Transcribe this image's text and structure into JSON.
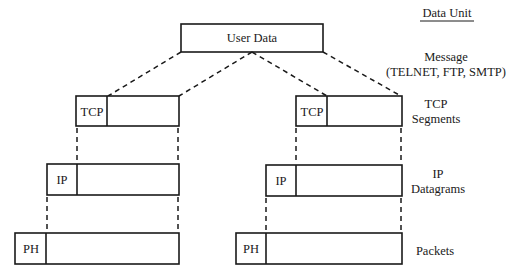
{
  "header": {
    "data_unit_title": "Data Unit"
  },
  "user_data": {
    "label": "User Data"
  },
  "layers": {
    "message": {
      "line1": "Message",
      "line2": "(TELNET, FTP, SMTP)"
    },
    "tcp": {
      "header": "TCP",
      "line1": "TCP",
      "line2": "Segments"
    },
    "ip": {
      "header": "IP",
      "line1": "IP",
      "line2": "Datagrams"
    },
    "packet": {
      "header": "PH",
      "line1": "Packets"
    }
  }
}
